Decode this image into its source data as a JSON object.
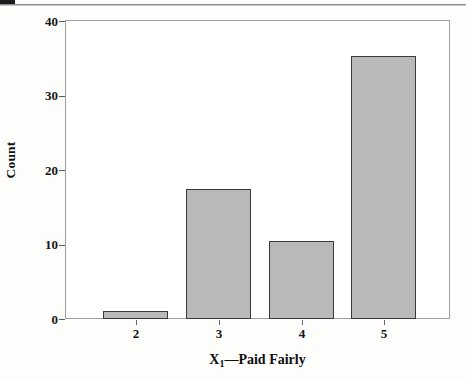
{
  "page": {
    "background_color": "#fdfdfc",
    "tab_mark_color": "#1b1b1b",
    "rule_color": "#8d8d8d"
  },
  "chart_data": {
    "type": "bar",
    "title": "",
    "subtitle": "",
    "xlabel": "X₁—Paid Fairly",
    "xlabel_base": "X",
    "xlabel_sub": "1",
    "xlabel_rest": "—Paid Fairly",
    "ylabel": "Count",
    "categories": [
      "2",
      "3",
      "4",
      "5"
    ],
    "values": [
      1.1,
      17.4,
      10.4,
      35.2
    ],
    "ylim": [
      0,
      40
    ],
    "xlim": [
      1.5,
      5.5
    ],
    "yticks": [
      0,
      10,
      20,
      30,
      40
    ],
    "ytick_labels": [
      "0",
      "10",
      "20",
      "30",
      "40"
    ],
    "xtick_labels": [
      "2",
      "3",
      "4",
      "5"
    ],
    "grid": false,
    "legend": false,
    "legend_position": "none",
    "bar_fill_color": "#b9b9b9",
    "bar_border_color": "#3a3a3a",
    "axis_color": "#a0a0a0",
    "plot_background": "#ffffff",
    "bars": [
      {
        "category": "2",
        "value": 1.1,
        "left_px": 37,
        "width_px": 65,
        "height_px": 8,
        "center_px": 69.5
      },
      {
        "category": "3",
        "value": 17.4,
        "left_px": 120,
        "width_px": 65,
        "height_px": 130,
        "center_px": 152.5
      },
      {
        "category": "4",
        "value": 10.4,
        "left_px": 203,
        "width_px": 65,
        "height_px": 78,
        "center_px": 235.5
      },
      {
        "category": "5",
        "value": 35.2,
        "left_px": 285,
        "width_px": 65,
        "height_px": 263,
        "center_px": 317.5
      }
    ],
    "ytick_positions_px": [
      299,
      224.25,
      149.5,
      74.75,
      0
    ]
  }
}
